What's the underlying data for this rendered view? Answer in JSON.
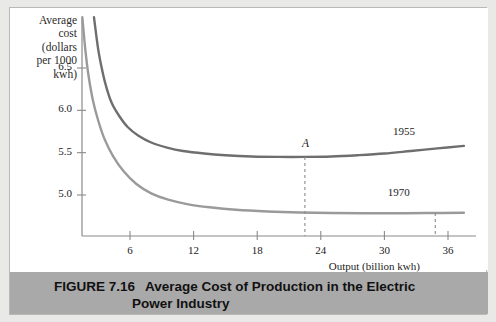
{
  "chart_data": {
    "type": "line",
    "title": "Average Cost of Production in the Electric Power Industry",
    "figure_number": "FIGURE 7.16",
    "caption_line1": "Average Cost of Production in the Electric",
    "caption_line2": "Power Industry",
    "xlabel": "Output (billion kwh)",
    "ylabel": "Average cost (dollars per 1000 kwh)",
    "ylabel_lines": [
      "Average",
      "cost",
      "(dollars",
      "per 1000",
      "kwh)"
    ],
    "xlim": [
      0,
      38
    ],
    "ylim": [
      4.6,
      7.1
    ],
    "xticks": [
      6,
      12,
      18,
      24,
      30,
      36
    ],
    "yticks": [
      5.0,
      5.5,
      6.0,
      6.5
    ],
    "xtick_labels": [
      "6",
      "12",
      "18",
      "24",
      "30",
      "36"
    ],
    "ytick_labels": [
      "5.0",
      "5.5",
      "6.0",
      "6.5"
    ],
    "grid": false,
    "legend_position": "inline-annotation",
    "series": [
      {
        "name": "1955",
        "label": "1955",
        "color": "#6e6e6e",
        "label_x": 31.0,
        "label_y": 5.74,
        "points": [
          [
            2.6,
            7.1
          ],
          [
            3.0,
            6.72
          ],
          [
            3.4,
            6.46
          ],
          [
            3.8,
            6.26
          ],
          [
            4.3,
            6.08
          ],
          [
            5.0,
            5.93
          ],
          [
            5.8,
            5.8
          ],
          [
            6.8,
            5.7
          ],
          [
            8.0,
            5.62
          ],
          [
            9.5,
            5.56
          ],
          [
            11.0,
            5.52
          ],
          [
            13.0,
            5.49
          ],
          [
            15.0,
            5.47
          ],
          [
            17.5,
            5.455
          ],
          [
            20.0,
            5.45
          ],
          [
            22.5,
            5.45
          ],
          [
            25.0,
            5.455
          ],
          [
            27.5,
            5.47
          ],
          [
            30.0,
            5.49
          ],
          [
            32.5,
            5.52
          ],
          [
            35.0,
            5.55
          ],
          [
            37.5,
            5.58
          ]
        ]
      },
      {
        "name": "1970",
        "label": "1970",
        "color": "#9a9a9a",
        "label_x": 30.5,
        "label_y": 5.02,
        "points": [
          [
            1.5,
            7.1
          ],
          [
            1.8,
            6.7
          ],
          [
            2.1,
            6.4
          ],
          [
            2.5,
            6.12
          ],
          [
            3.0,
            5.88
          ],
          [
            3.6,
            5.66
          ],
          [
            4.4,
            5.46
          ],
          [
            5.4,
            5.28
          ],
          [
            6.6,
            5.13
          ],
          [
            8.0,
            5.02
          ],
          [
            9.6,
            4.945
          ],
          [
            11.5,
            4.89
          ],
          [
            13.5,
            4.855
          ],
          [
            16.0,
            4.825
          ],
          [
            19.0,
            4.805
          ],
          [
            22.0,
            4.793
          ],
          [
            25.0,
            4.787
          ],
          [
            28.0,
            4.784
          ],
          [
            31.0,
            4.784
          ],
          [
            34.0,
            4.787
          ],
          [
            37.5,
            4.79
          ]
        ]
      }
    ],
    "annotations": [
      {
        "name": "point-a",
        "label": "A",
        "x": 22.5,
        "y": 5.45,
        "dashed_drop_to_axis": true
      },
      {
        "name": "point-1970-drop",
        "label": "",
        "x": 34.8,
        "y": 4.787,
        "dashed_drop_to_axis": true
      }
    ]
  }
}
